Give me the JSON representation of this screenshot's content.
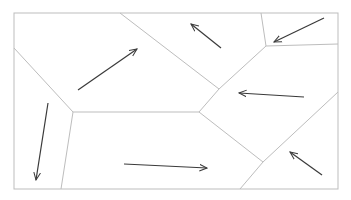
{
  "diagram": {
    "type": "voronoi-vector-field",
    "colors": {
      "background": "#ffffff",
      "cell_border": "#bdbdbd",
      "arrow": "#3a3a3a"
    },
    "frame": {
      "x1": 14,
      "y1": 13,
      "x2": 338,
      "y2": 189
    },
    "edges": [
      [
        14,
        48,
        73,
        112
      ],
      [
        73,
        112,
        61,
        189
      ],
      [
        73,
        112,
        199,
        112
      ],
      [
        120,
        13,
        219,
        89
      ],
      [
        219,
        89,
        199,
        112
      ],
      [
        219,
        89,
        266,
        46
      ],
      [
        261,
        13,
        266,
        46
      ],
      [
        266,
        46,
        338,
        44
      ],
      [
        199,
        112,
        263,
        162
      ],
      [
        263,
        162,
        338,
        92
      ],
      [
        263,
        162,
        240,
        189
      ]
    ],
    "arrows": [
      {
        "name": "arrow-cell-top-left",
        "x1": 78,
        "y1": 90,
        "x2": 137,
        "y2": 49
      },
      {
        "name": "arrow-cell-top-middle",
        "x1": 221,
        "y1": 48,
        "x2": 191,
        "y2": 24
      },
      {
        "name": "arrow-cell-top-right",
        "x1": 324,
        "y1": 18,
        "x2": 274,
        "y2": 42
      },
      {
        "name": "arrow-cell-middle-right",
        "x1": 304,
        "y1": 97,
        "x2": 239,
        "y2": 93
      },
      {
        "name": "arrow-cell-bottom-left",
        "x1": 48,
        "y1": 103,
        "x2": 36,
        "y2": 180
      },
      {
        "name": "arrow-cell-bottom-middle",
        "x1": 124,
        "y1": 164,
        "x2": 207,
        "y2": 168
      },
      {
        "name": "arrow-cell-bottom-right",
        "x1": 322,
        "y1": 175,
        "x2": 290,
        "y2": 152
      }
    ]
  }
}
